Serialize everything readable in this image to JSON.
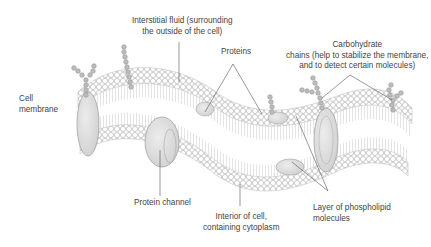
{
  "diagram": {
    "labels": {
      "cell_membrane": [
        "Cell",
        "membrane"
      ],
      "interstitial_fluid": [
        "Interstitial fluid (surrounding",
        "the outside of the cell)"
      ],
      "proteins": [
        "Proteins"
      ],
      "carbohydrate_chains": [
        "Carbohydrate",
        "chains (help to stabilize the membrane,",
        "and to detect certain molecules)"
      ],
      "protein_channel": [
        "Protein channel"
      ],
      "interior_of_cell": [
        "Interior of cell,",
        "containing cytoplasm"
      ],
      "phospholipid_layer": [
        "Layer of phospholipid",
        "molecules"
      ]
    },
    "colors": {
      "background": "#ffffff",
      "head_fill": "#ffffff",
      "head_stroke": "#b8b8b8",
      "protein_fill": "#dcdcdc",
      "protein_stroke": "#9a9a9a",
      "carb_fill": "#b0b0b0",
      "leader_line": "#555555",
      "text": "#444444"
    }
  }
}
